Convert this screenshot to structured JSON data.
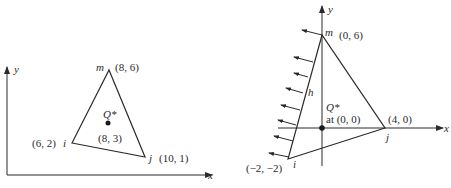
{
  "left_figure": {
    "axes": {
      "x_label": "x",
      "y_label": "y"
    },
    "nodes": [
      {
        "name": "i",
        "coord": "(6, 2)"
      },
      {
        "name": "j",
        "coord": "(10, 1)"
      },
      {
        "name": "m",
        "coord": "(8, 6)"
      }
    ],
    "point": {
      "name": "Q*",
      "coord": "(8, 3)"
    }
  },
  "right_figure": {
    "axes": {
      "x_label": "x",
      "y_label": "y"
    },
    "nodes": [
      {
        "name": "i",
        "coord": "(−2, −2)"
      },
      {
        "name": "j",
        "coord": "(4, 0)"
      },
      {
        "name": "m",
        "coord": "(0, 6)"
      }
    ],
    "point": {
      "name": "Q*",
      "coord": "at (0, 0)"
    },
    "edge_label": "h",
    "flux_arrows": 8
  },
  "colors": {
    "stroke": "#2a2a2a",
    "background": "#ffffff"
  }
}
